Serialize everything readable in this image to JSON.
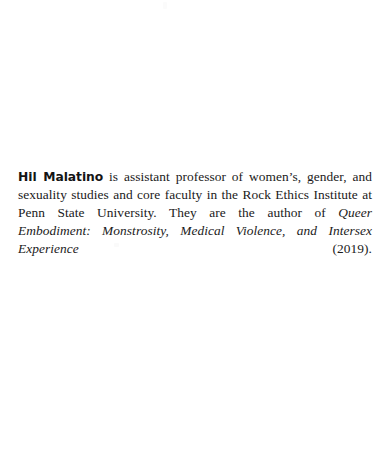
{
  "page": {
    "background_color": "#ffffff",
    "text_color": "#1a1a1a"
  },
  "bio": {
    "author_name": "Hil Malatino",
    "text_before_title": " is assistant professor of women’s, gender, and sexuality studies and core faculty in the Rock Ethics Institute at Penn State University. They are the author of ",
    "work_title": "Queer Embodiment: Monstrosity, Medical Violence, and Intersex Experience",
    "text_after_title": " (2019).",
    "full_text": "Hil Malatino is assistant professor of women’s, gender, and sexuality studies and core faculty in the Rock Ethics Institute at Penn State University. They are the author of Queer Embodiment: Monstrosity, Medical Violence, and Intersex Experience (2019)."
  }
}
